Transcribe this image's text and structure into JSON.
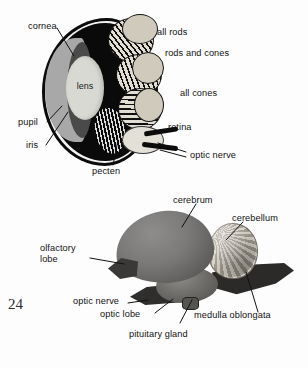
{
  "page": {
    "number": "24",
    "background_color": "#fdfdfd",
    "text_color": "#121212"
  },
  "figures": [
    {
      "id": "bird-eye-section",
      "title": "Vertical section of a bird's eye",
      "type": "anatomical-diagram",
      "labels": [
        {
          "key": "cornea",
          "text": "cornea"
        },
        {
          "key": "lens",
          "text": "lens"
        },
        {
          "key": "pupil",
          "text": "pupil"
        },
        {
          "key": "iris",
          "text": "iris"
        },
        {
          "key": "pecten",
          "text": "pecten"
        },
        {
          "key": "all_rods",
          "text": "all rods"
        },
        {
          "key": "rods_and_cones",
          "text": "rods and cones"
        },
        {
          "key": "all_cones",
          "text": "all cones"
        },
        {
          "key": "retina",
          "text": "retina"
        },
        {
          "key": "optic_nerve",
          "text": "optic nerve"
        }
      ]
    },
    {
      "id": "bird-brain-lateral",
      "title": "Lateral view of a bird's brain",
      "type": "anatomical-diagram",
      "labels": [
        {
          "key": "cerebrum",
          "text": "cerebrum"
        },
        {
          "key": "cerebellum",
          "text": "cerebellum"
        },
        {
          "key": "olfactory_lobe",
          "text": "olfactory\nlobe"
        },
        {
          "key": "optic_nerve",
          "text": "optic nerve"
        },
        {
          "key": "optic_lobe",
          "text": "optic lobe"
        },
        {
          "key": "medulla_oblongata",
          "text": "medulla oblongata"
        },
        {
          "key": "pituitary_gland",
          "text": "pituitary gland"
        }
      ]
    }
  ],
  "eye_labels": {
    "cornea": "cornea",
    "lens": "lens",
    "pupil": "pupil",
    "iris": "iris",
    "pecten": "pecten",
    "all_rods": "all rods",
    "rods_and_cones": "rods and cones",
    "all_cones": "all cones",
    "retina": "retina",
    "optic_nerve": "optic nerve"
  },
  "brain_labels": {
    "cerebrum": "cerebrum",
    "cerebellum": "cerebellum",
    "olfactory_lobe": "olfactory\nlobe",
    "optic_nerve": "optic nerve",
    "optic_lobe": "optic lobe",
    "medulla_oblongata": "medulla oblongata",
    "pituitary_gland": "pituitary gland"
  }
}
